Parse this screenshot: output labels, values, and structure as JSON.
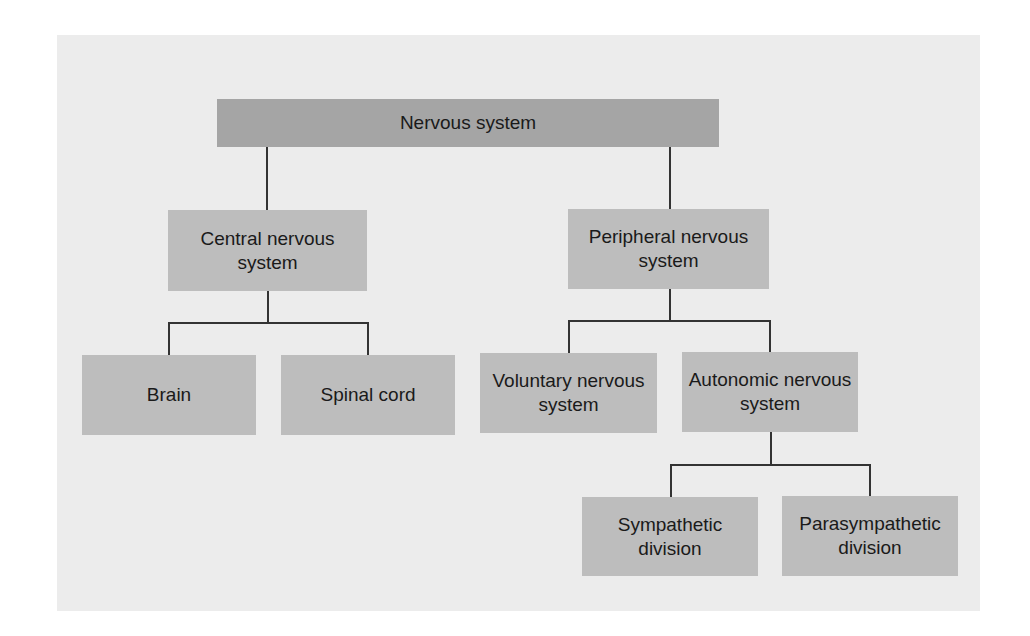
{
  "diagram": {
    "type": "hierarchy",
    "colors": {
      "panel_background": "#ececec",
      "root_box": "#a5a5a5",
      "node_box": "#bdbdbd",
      "connector": "#333333",
      "text": "#1a1a1a"
    },
    "root": {
      "label": "Nervous system"
    },
    "level1": {
      "central": {
        "label": "Central nervous system"
      },
      "peripheral": {
        "label": "Peripheral nervous system"
      }
    },
    "level2": {
      "brain": {
        "label": "Brain"
      },
      "spinal_cord": {
        "label": "Spinal cord"
      },
      "voluntary": {
        "label": "Voluntary nervous system"
      },
      "autonomic": {
        "label": "Autonomic nervous system"
      }
    },
    "level3": {
      "sympathetic": {
        "label": "Sympathetic division"
      },
      "parasympathetic": {
        "label": "Parasympathetic division"
      }
    },
    "edges": [
      [
        "Nervous system",
        "Central nervous system"
      ],
      [
        "Nervous system",
        "Peripheral nervous system"
      ],
      [
        "Central nervous system",
        "Brain"
      ],
      [
        "Central nervous system",
        "Spinal cord"
      ],
      [
        "Peripheral nervous system",
        "Voluntary nervous system"
      ],
      [
        "Peripheral nervous system",
        "Autonomic nervous system"
      ],
      [
        "Autonomic nervous system",
        "Sympathetic division"
      ],
      [
        "Autonomic nervous system",
        "Parasympathetic division"
      ]
    ]
  }
}
